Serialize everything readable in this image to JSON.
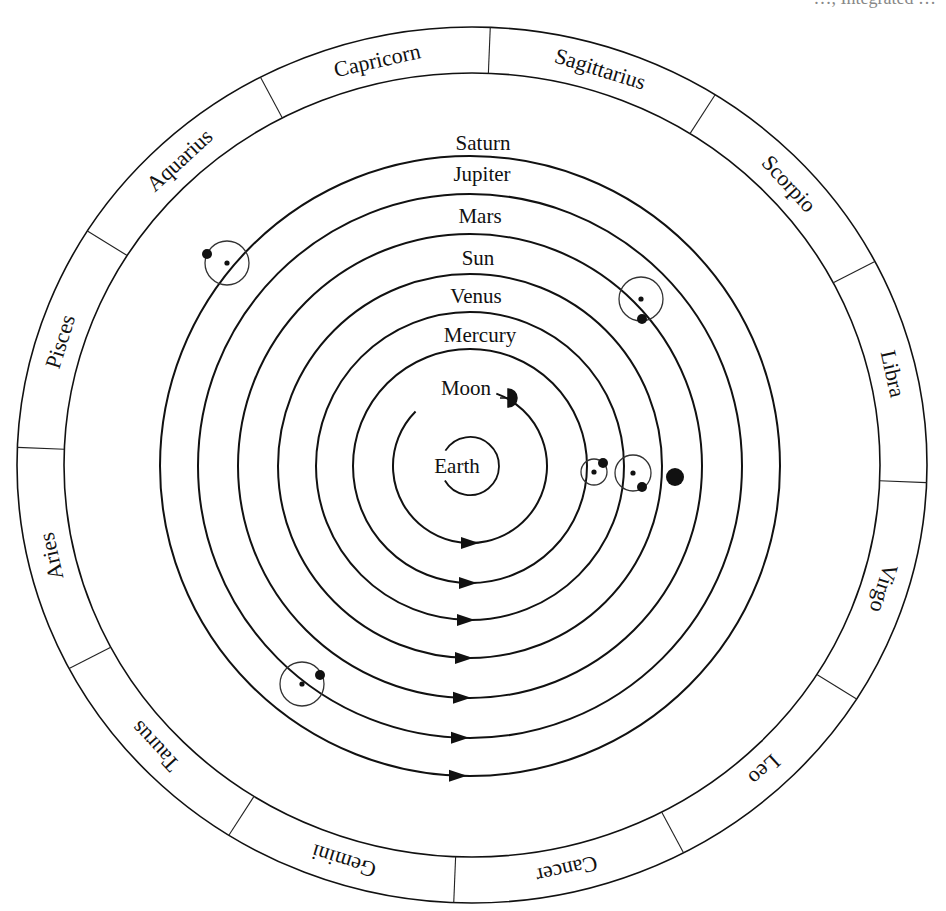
{
  "header_fragment": "…, Integrated …",
  "diagram": {
    "type": "geocentric-model",
    "center_body": "Earth",
    "orbits": [
      {
        "name": "Moon",
        "order": 1,
        "marker": "half-disc"
      },
      {
        "name": "Mercury",
        "order": 2,
        "marker": "epicycle"
      },
      {
        "name": "Venus",
        "order": 3,
        "marker": "epicycle"
      },
      {
        "name": "Sun",
        "order": 4,
        "marker": "large-dot"
      },
      {
        "name": "Mars",
        "order": 5,
        "marker": "epicycle"
      },
      {
        "name": "Jupiter",
        "order": 6,
        "marker": "epicycle"
      },
      {
        "name": "Saturn",
        "order": 7,
        "marker": "epicycle"
      }
    ],
    "direction_arrows": "counterclockwise-as-seen (pointing right at bottom)",
    "zodiac": [
      "Capricorn",
      "Sagittarius",
      "Scorpio",
      "Libra",
      "Virgo",
      "Leo",
      "Cancer",
      "Gemini",
      "Taurus",
      "Aries",
      "Pisces",
      "Aquarius"
    ],
    "colors": {
      "ink": "#111111",
      "background": "#ffffff"
    }
  }
}
